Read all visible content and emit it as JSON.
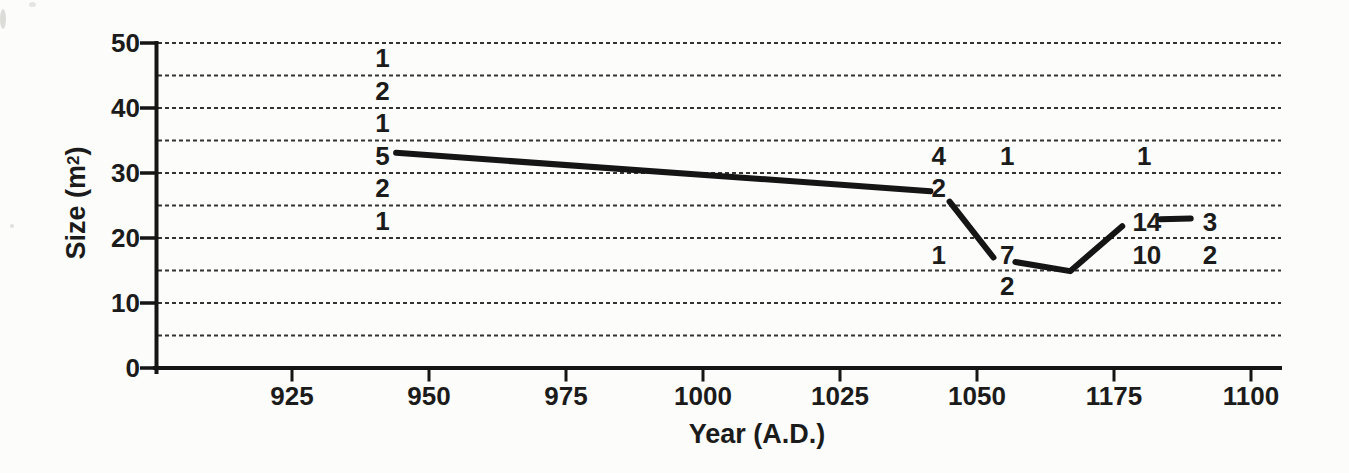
{
  "figure": {
    "background_color": "#fcfcfa",
    "ink_color": "#151515",
    "grid_color": "#333333"
  },
  "chart_data": {
    "type": "line",
    "title": "",
    "xlabel": "Year (A.D.)",
    "ylabel": "Size (m²)",
    "ylabel_parts": {
      "prefix": "Size (m",
      "sup": "2",
      "suffix": ")"
    },
    "x_tick_labels": [
      "925",
      "950",
      "975",
      "1000",
      "1025",
      "1050",
      "1175",
      "1100"
    ],
    "x_tick_year_start": 925,
    "x_tick_year_step": 25,
    "y_ticks": [
      0,
      10,
      20,
      30,
      40,
      50
    ],
    "ylim": [
      0,
      50
    ],
    "grid_step": 5,
    "grid_style": "dashed",
    "legend": "none",
    "line_segments": [
      {
        "points": [
          [
            944,
            33.1
          ],
          [
            1041.5,
            27.2
          ]
        ]
      },
      {
        "points": [
          [
            1045,
            25.6
          ],
          [
            1053,
            17.0
          ]
        ]
      },
      {
        "points": [
          [
            1057,
            16.3
          ],
          [
            1067,
            14.9
          ],
          [
            1076.5,
            21.8
          ]
        ]
      },
      {
        "points": [
          [
            1083.5,
            22.9
          ],
          [
            1089,
            23.0
          ]
        ]
      }
    ],
    "annotations": [
      {
        "year": 941.5,
        "size": 47.5,
        "label": "1"
      },
      {
        "year": 941.5,
        "size": 42.5,
        "label": "2"
      },
      {
        "year": 941.5,
        "size": 37.5,
        "label": "1"
      },
      {
        "year": 941.5,
        "size": 32.5,
        "label": "5"
      },
      {
        "year": 941.5,
        "size": 27.5,
        "label": "2"
      },
      {
        "year": 941.5,
        "size": 22.5,
        "label": "1"
      },
      {
        "year": 1043,
        "size": 32.5,
        "label": "4"
      },
      {
        "year": 1055.5,
        "size": 32.5,
        "label": "1"
      },
      {
        "year": 1080.5,
        "size": 32.5,
        "label": "1"
      },
      {
        "year": 1043,
        "size": 27.5,
        "label": "2"
      },
      {
        "year": 1043,
        "size": 17.3,
        "label": "1"
      },
      {
        "year": 1055.5,
        "size": 17.3,
        "label": "7"
      },
      {
        "year": 1055.5,
        "size": 12.4,
        "label": "2"
      },
      {
        "year": 1081,
        "size": 22.3,
        "label": "14"
      },
      {
        "year": 1092.5,
        "size": 22.3,
        "label": "3"
      },
      {
        "year": 1081,
        "size": 17.2,
        "label": "10"
      },
      {
        "year": 1092.5,
        "size": 17.2,
        "label": "2"
      }
    ]
  }
}
